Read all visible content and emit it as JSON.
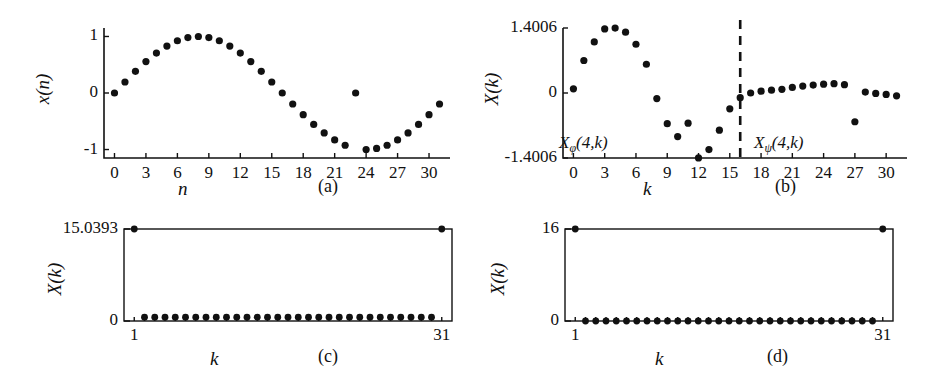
{
  "figure": {
    "panels": [
      {
        "id": "a",
        "caption": "(a)",
        "xlabel": "n",
        "ylabel": "x(n)",
        "yticks": [
          "1",
          "0",
          "-1"
        ],
        "xticks": [
          "0",
          "3",
          "6",
          "9",
          "12",
          "15",
          "18",
          "21",
          "24",
          "27",
          "30"
        ]
      },
      {
        "id": "b",
        "caption": "(b)",
        "xlabel": "k",
        "ylabel": "X(k)",
        "yticks": [
          "1.4006",
          "0",
          "-1.4006"
        ],
        "xticks": [
          "0",
          "3",
          "6",
          "9",
          "12",
          "15",
          "18",
          "21",
          "24",
          "27",
          "30"
        ],
        "annotation_left_base": "X",
        "annotation_left_sub": "φ",
        "annotation_left_args": "(4,k)",
        "annotation_right_base": "X",
        "annotation_right_sub": "ψ",
        "annotation_right_args": "(4,k)"
      },
      {
        "id": "c",
        "caption": "(c)",
        "xlabel": "k",
        "ylabel": "X(k)",
        "yticks": [
          "15.0393",
          "0"
        ],
        "xticks": [
          "1",
          "31"
        ]
      },
      {
        "id": "d",
        "caption": "(d)",
        "xlabel": "k",
        "ylabel": "X(k)",
        "yticks": [
          "16",
          "0"
        ],
        "xticks": [
          "1",
          "31"
        ]
      }
    ]
  },
  "chart_data": [
    {
      "type": "scatter",
      "panel": "a",
      "title": "",
      "xlabel": "n",
      "ylabel": "x(n)",
      "xlim": [
        -1,
        32
      ],
      "ylim": [
        -1.15,
        1.15
      ],
      "yticks": [
        1,
        0,
        -1
      ],
      "xticks": [
        0,
        3,
        6,
        9,
        12,
        15,
        18,
        21,
        24,
        27,
        30
      ],
      "grid": false,
      "x": [
        0,
        1,
        2,
        3,
        4,
        5,
        6,
        7,
        8,
        9,
        10,
        11,
        12,
        13,
        14,
        15,
        16,
        17,
        18,
        19,
        20,
        21,
        22,
        23,
        24,
        25,
        26,
        27,
        28,
        29,
        30,
        31
      ],
      "values": [
        0.0,
        0.195,
        0.383,
        0.556,
        0.707,
        0.831,
        0.924,
        0.981,
        1.0,
        0.981,
        0.924,
        0.831,
        0.707,
        0.556,
        0.383,
        0.195,
        0.0,
        -0.195,
        -0.383,
        -0.556,
        -0.707,
        -0.831,
        -0.924,
        0.0,
        -1.0,
        -0.981,
        -0.924,
        -0.831,
        -0.707,
        -0.556,
        -0.383,
        -0.195
      ],
      "note": "sine of period 32 with a single corrupted sample at n=23 set to 0"
    },
    {
      "type": "scatter",
      "panel": "b",
      "title": "",
      "xlabel": "k",
      "ylabel": "X(k)",
      "xlim": [
        -1,
        32
      ],
      "ylim": [
        -1.4006,
        1.4006
      ],
      "yticks": [
        1.4006,
        0,
        -1.4006
      ],
      "xticks": [
        0,
        3,
        6,
        9,
        12,
        15,
        18,
        21,
        24,
        27,
        30
      ],
      "grid": false,
      "divider_x": 16,
      "x": [
        0,
        1,
        2,
        3,
        4,
        5,
        6,
        7,
        8,
        9,
        10,
        11,
        12,
        13,
        14,
        15,
        16,
        17,
        18,
        19,
        20,
        21,
        22,
        23,
        24,
        25,
        26,
        27,
        28,
        29,
        30,
        31
      ],
      "values": [
        0.09,
        0.7,
        1.1,
        1.38,
        1.4,
        1.31,
        1.05,
        0.62,
        -0.12,
        -0.66,
        -0.94,
        -0.65,
        -1.4,
        -1.22,
        -0.8,
        -0.34,
        -0.1,
        0.0,
        0.04,
        0.06,
        0.08,
        0.12,
        0.15,
        0.17,
        0.19,
        0.2,
        0.18,
        -0.62,
        0.02,
        -0.01,
        -0.03,
        -0.06
      ],
      "note": "left half labelled X_phi(4,k), right half labelled X_psi(4,k); dashed vertical divider near k=16"
    },
    {
      "type": "scatter",
      "panel": "c",
      "title": "",
      "xlabel": "k",
      "ylabel": "X(k)",
      "xlim": [
        0,
        32
      ],
      "ylim": [
        0,
        15.0393
      ],
      "yticks": [
        15.0393,
        0
      ],
      "xticks": [
        1,
        31
      ],
      "grid": false,
      "x": [
        1,
        2,
        3,
        4,
        5,
        6,
        7,
        8,
        9,
        10,
        11,
        12,
        13,
        14,
        15,
        16,
        17,
        18,
        19,
        20,
        21,
        22,
        23,
        24,
        25,
        26,
        27,
        28,
        29,
        30,
        31
      ],
      "values": [
        15.0393,
        0.62,
        0.62,
        0.62,
        0.62,
        0.62,
        0.62,
        0.62,
        0.62,
        0.62,
        0.62,
        0.62,
        0.62,
        0.62,
        0.62,
        0.62,
        0.62,
        0.62,
        0.62,
        0.62,
        0.62,
        0.62,
        0.62,
        0.62,
        0.62,
        0.62,
        0.62,
        0.62,
        0.62,
        0.62,
        15.0393
      ],
      "note": "DFT magnitude of corrupted signal: peaks 15.0393 at k=1 and k=31, small non-zero floor elsewhere"
    },
    {
      "type": "scatter",
      "panel": "d",
      "title": "",
      "xlabel": "k",
      "ylabel": "X(k)",
      "xlim": [
        0,
        32
      ],
      "ylim": [
        0,
        16
      ],
      "yticks": [
        16,
        0
      ],
      "xticks": [
        1,
        31
      ],
      "grid": false,
      "x": [
        1,
        2,
        3,
        4,
        5,
        6,
        7,
        8,
        9,
        10,
        11,
        12,
        13,
        14,
        15,
        16,
        17,
        18,
        19,
        20,
        21,
        22,
        23,
        24,
        25,
        26,
        27,
        28,
        29,
        30,
        31
      ],
      "values": [
        16,
        0,
        0,
        0,
        0,
        0,
        0,
        0,
        0,
        0,
        0,
        0,
        0,
        0,
        0,
        0,
        0,
        0,
        0,
        0,
        0,
        0,
        0,
        0,
        0,
        0,
        0,
        0,
        0,
        0,
        16
      ],
      "note": "DFT magnitude of restored signal: exact impulses 16 at k=1 and k=31, zero elsewhere"
    }
  ]
}
